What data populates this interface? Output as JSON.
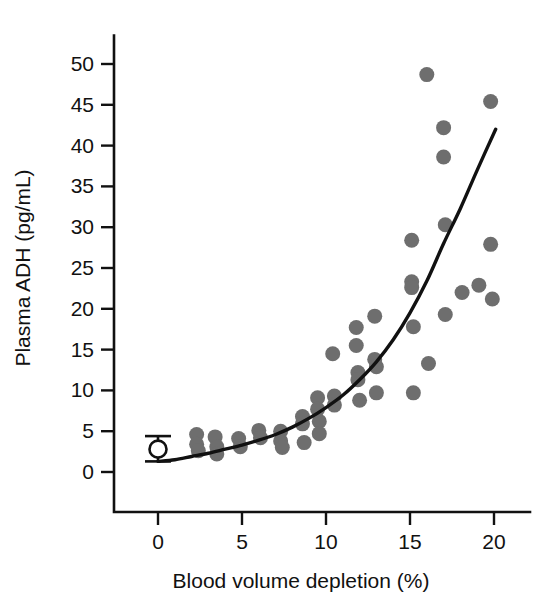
{
  "chart_data": {
    "type": "scatter",
    "title": "",
    "xlabel": "Blood volume depletion (%)",
    "ylabel": "Plasma ADH (pg/mL)",
    "xlim": [
      -1.2,
      21.5
    ],
    "ylim": [
      -2.0,
      53.5
    ],
    "xticks": [
      0,
      5,
      10,
      15,
      20
    ],
    "xtick_labels": [
      "0",
      "5",
      "10",
      "15",
      "20"
    ],
    "yticks": [
      0,
      5,
      10,
      15,
      20,
      25,
      30,
      35,
      40,
      45,
      50
    ],
    "ytick_labels": [
      "0",
      "5",
      "10",
      "15",
      "20",
      "25",
      "30",
      "35",
      "40",
      "45",
      "50"
    ],
    "grid": false,
    "legend": "none",
    "marker_color": "#6e6e6e",
    "marker_radius_px": 7.5,
    "line_color": "#111111",
    "axis_color": "#111111",
    "background": "#ffffff",
    "series": [
      {
        "name": "Subjects",
        "marker": "filled-circle",
        "color": "#6e6e6e",
        "points": [
          [
            2.3,
            4.6
          ],
          [
            2.3,
            3.4
          ],
          [
            2.4,
            2.6
          ],
          [
            3.4,
            4.3
          ],
          [
            3.5,
            3.1
          ],
          [
            3.5,
            2.2
          ],
          [
            4.8,
            4.1
          ],
          [
            4.9,
            3.1
          ],
          [
            6.0,
            5.1
          ],
          [
            6.1,
            4.2
          ],
          [
            7.3,
            5.0
          ],
          [
            7.3,
            3.8
          ],
          [
            7.4,
            3.0
          ],
          [
            8.6,
            6.8
          ],
          [
            8.6,
            5.9
          ],
          [
            8.7,
            3.6
          ],
          [
            9.5,
            9.1
          ],
          [
            9.5,
            7.7
          ],
          [
            9.6,
            6.2
          ],
          [
            9.6,
            4.7
          ],
          [
            10.4,
            14.5
          ],
          [
            10.5,
            9.3
          ],
          [
            10.5,
            8.2
          ],
          [
            11.8,
            17.7
          ],
          [
            11.8,
            15.5
          ],
          [
            11.9,
            12.2
          ],
          [
            11.9,
            11.3
          ],
          [
            12.0,
            8.8
          ],
          [
            12.9,
            19.1
          ],
          [
            12.9,
            13.8
          ],
          [
            13.0,
            12.9
          ],
          [
            13.0,
            9.7
          ],
          [
            15.1,
            28.4
          ],
          [
            15.1,
            23.3
          ],
          [
            15.1,
            22.6
          ],
          [
            15.2,
            17.8
          ],
          [
            15.2,
            9.7
          ],
          [
            16.0,
            48.7
          ],
          [
            16.1,
            13.3
          ],
          [
            17.0,
            42.2
          ],
          [
            17.0,
            38.6
          ],
          [
            17.1,
            30.3
          ],
          [
            17.1,
            19.3
          ],
          [
            18.1,
            22.0
          ],
          [
            19.1,
            22.9
          ],
          [
            19.8,
            45.4
          ],
          [
            19.8,
            27.9
          ],
          [
            19.9,
            21.2
          ]
        ]
      }
    ],
    "fit_curve": {
      "name": "Exponential fit",
      "color": "#111111",
      "x_start": 0.0,
      "x_end": 20.1,
      "points": [
        [
          0.0,
          1.3
        ],
        [
          1.0,
          1.5
        ],
        [
          2.0,
          1.9
        ],
        [
          3.0,
          2.3
        ],
        [
          4.0,
          2.8
        ],
        [
          5.0,
          3.3
        ],
        [
          6.0,
          3.9
        ],
        [
          7.0,
          4.6
        ],
        [
          8.0,
          5.5
        ],
        [
          9.0,
          6.6
        ],
        [
          10.0,
          7.9
        ],
        [
          11.0,
          9.4
        ],
        [
          12.0,
          11.3
        ],
        [
          13.0,
          13.5
        ],
        [
          14.0,
          16.2
        ],
        [
          15.0,
          19.5
        ],
        [
          16.0,
          23.4
        ],
        [
          17.0,
          28.0
        ],
        [
          18.0,
          32.3
        ],
        [
          19.0,
          37.0
        ],
        [
          20.1,
          42.0
        ]
      ]
    },
    "reference_point": {
      "name": "Baseline (euvolemic)",
      "marker": "open-circle",
      "x": 0.0,
      "y": 2.8,
      "error_low": 1.3,
      "error_high": 4.4,
      "fill": "#ffffff",
      "stroke": "#111111"
    }
  }
}
